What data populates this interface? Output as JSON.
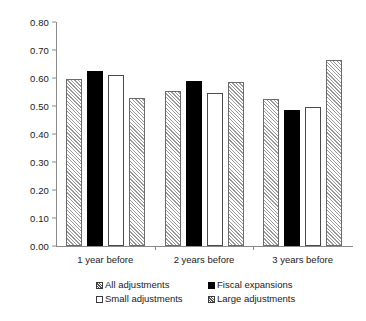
{
  "chart_data": {
    "type": "bar",
    "title": "",
    "xlabel": "",
    "ylabel": "",
    "ylim": [
      0.0,
      0.8
    ],
    "grid": false,
    "legend_position": "bottom",
    "categories": [
      "1 year before",
      "2 years before",
      "3 years before"
    ],
    "ytick_labels": [
      "0.80",
      "0.70",
      "0.60",
      "0.50",
      "0.40",
      "0.30",
      "0.20",
      "0.10",
      "0.00"
    ],
    "ytick_values": [
      0.8,
      0.7,
      0.6,
      0.5,
      0.4,
      0.3,
      0.2,
      0.1,
      0.0
    ],
    "series": [
      {
        "name": "All adjustments",
        "style": "hatch",
        "values": [
          0.595,
          0.555,
          0.525
        ]
      },
      {
        "name": "Fiscal expansions",
        "style": "solid",
        "values": [
          0.625,
          0.588,
          0.485
        ]
      },
      {
        "name": "Small adjustments",
        "style": "open",
        "values": [
          0.61,
          0.545,
          0.498
        ]
      },
      {
        "name": "Large adjustments",
        "style": "hatch",
        "values": [
          0.528,
          0.587,
          0.663
        ]
      }
    ]
  },
  "legend": {
    "entries": [
      {
        "label": "All adjustments",
        "swatch": "hatch-swatch"
      },
      {
        "label": "Fiscal expansions",
        "swatch": "solid-swatch"
      },
      {
        "label": "Small adjustments",
        "swatch": "open-swatch"
      },
      {
        "label": "Large adjustments",
        "swatch": "hatch-swatch"
      }
    ]
  }
}
